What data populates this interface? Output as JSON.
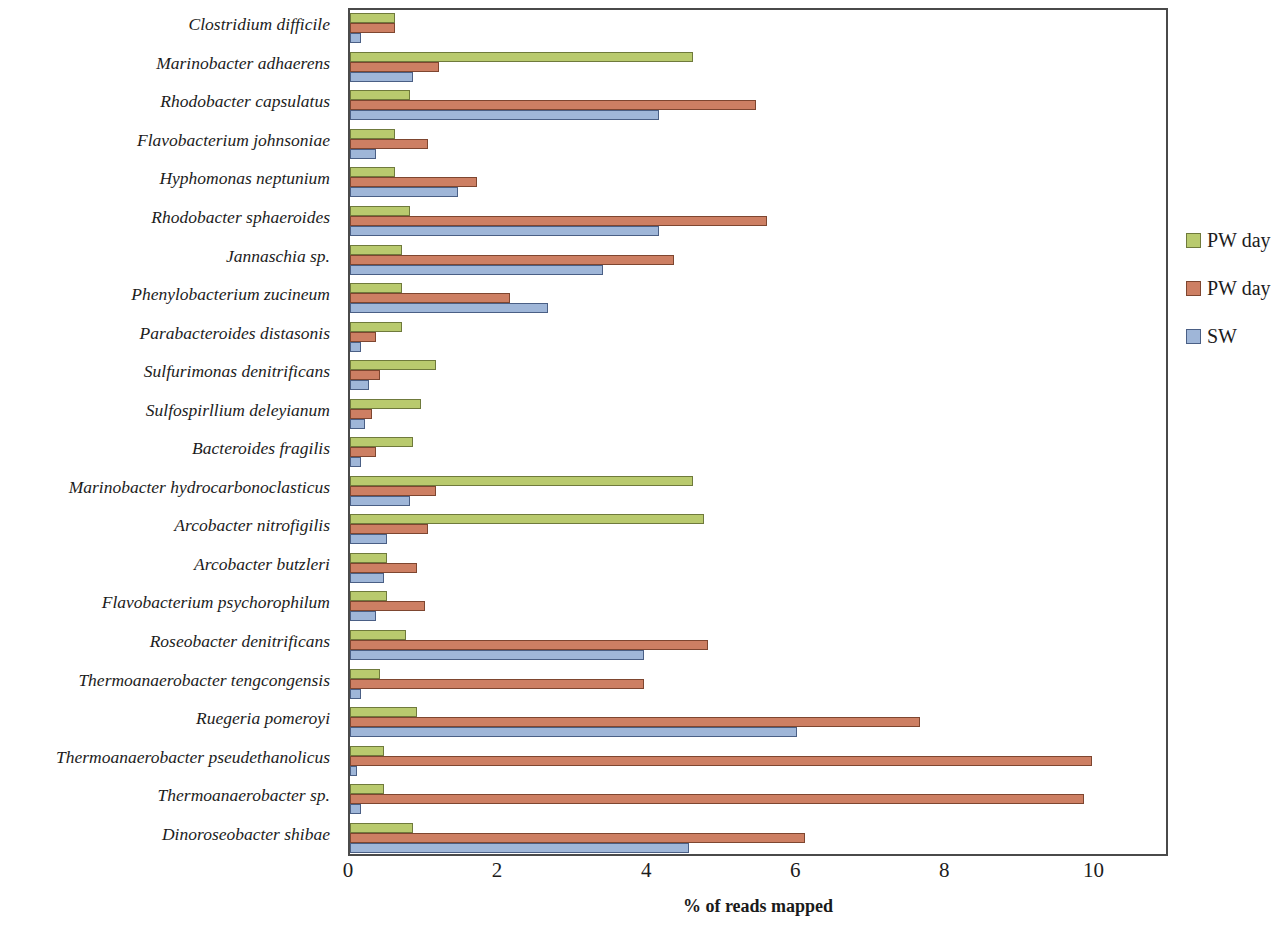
{
  "chart_data": {
    "type": "bar",
    "orientation": "horizontal",
    "title": "",
    "xlabel": "% of reads mapped",
    "ylabel": "",
    "xlim": [
      0,
      11
    ],
    "xticks": [
      0,
      2,
      4,
      6,
      8,
      10
    ],
    "xtick_labels": [
      "0",
      "2",
      "4",
      "6",
      "8",
      "10"
    ],
    "grid": false,
    "legend_position": "right",
    "colors": {
      "series_0": "#b9ca6e",
      "series_1": "#cd7f63",
      "series_2": "#9fb6d8",
      "series_0_edge": "#6f7a3c",
      "series_1_edge": "#7e4630",
      "series_2_edge": "#4a5f85",
      "frame": "#4a4a4a"
    },
    "categories": [
      "Clostridium difficile",
      "Marinobacter adhaerens",
      "Rhodobacter capsulatus",
      "Flavobacterium johnsoniae",
      "Hyphomonas neptunium",
      "Rhodobacter sphaeroides",
      "Jannaschia sp.",
      "Phenylobacterium zucineum",
      "Parabacteroides distasonis",
      "Sulfurimonas denitrificans",
      "Sulfospirllium deleyianum",
      "Bacteroides fragilis",
      "Marinobacter hydrocarbonoclasticus",
      "Arcobacter nitrofigilis",
      "Arcobacter butzleri",
      "Flavobacterium psychorophilum",
      "Roseobacter denitrificans",
      "Thermoanaerobacter tengcongensis",
      "Ruegeria pomeroyi",
      "Thermoanaerobacter pseudethanolicus",
      "Thermoanaerobacter sp.",
      "Dinoroseobacter shibae"
    ],
    "series": [
      {
        "name": "PW day",
        "color": "#b9ca6e",
        "values": [
          0.6,
          4.6,
          0.8,
          0.6,
          0.6,
          0.8,
          0.7,
          0.7,
          0.7,
          1.15,
          0.95,
          0.85,
          4.6,
          4.75,
          0.5,
          0.5,
          0.75,
          0.4,
          0.9,
          0.45,
          0.45,
          0.85
        ]
      },
      {
        "name": "PW day",
        "color": "#cd7f63",
        "values": [
          0.6,
          1.2,
          5.45,
          1.05,
          1.7,
          5.6,
          4.35,
          2.15,
          0.35,
          0.4,
          0.3,
          0.35,
          1.15,
          1.05,
          0.9,
          1.0,
          4.8,
          3.95,
          7.65,
          9.95,
          9.85,
          6.1
        ]
      },
      {
        "name": "SW",
        "color": "#9fb6d8",
        "values": [
          0.15,
          0.85,
          4.15,
          0.35,
          1.45,
          4.15,
          3.4,
          2.65,
          0.15,
          0.25,
          0.2,
          0.15,
          0.8,
          0.5,
          0.45,
          0.35,
          3.95,
          0.15,
          6.0,
          0.1,
          0.15,
          4.55
        ]
      }
    ]
  },
  "legend": {
    "items": [
      {
        "label": "PW day",
        "series_index": 0
      },
      {
        "label": "PW day",
        "series_index": 1
      },
      {
        "label": "SW",
        "series_index": 2
      }
    ]
  }
}
